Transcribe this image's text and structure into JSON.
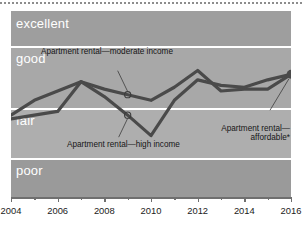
{
  "chart_data": {
    "type": "line",
    "title": "",
    "subtitle": "",
    "xlabel": "",
    "ylabel": "",
    "xlim": [
      2004,
      2016
    ],
    "ylim": [
      0,
      100
    ],
    "grid": false,
    "legend_position": "inline-annotations",
    "x": [
      2004,
      2005,
      2006,
      2007,
      2008,
      2009,
      2010,
      2011,
      2012,
      2013,
      2014,
      2015,
      2016
    ],
    "y_bands": [
      {
        "label": "excellent",
        "range": [
          81,
          100
        ],
        "color": "#9e9e9e"
      },
      {
        "label": "good",
        "range": [
          48,
          81
        ],
        "color": "#a8a8a8"
      },
      {
        "label": "fair",
        "range": [
          21,
          48
        ],
        "color": "#aeaeae"
      },
      {
        "label": "poor",
        "range": [
          0,
          21
        ],
        "color": "#9a9a9a"
      }
    ],
    "series": [
      {
        "name": "Apartment rental—moderate income",
        "color": "#4a4a4a",
        "values": [
          44,
          52,
          57,
          62,
          58,
          55,
          52,
          59,
          68,
          57,
          58,
          58,
          66
        ]
      },
      {
        "name": "Apartment rental—high income",
        "color": "#4a4a4a",
        "values": [
          42,
          44,
          46,
          62,
          54,
          44,
          33,
          52,
          63,
          60,
          59,
          63,
          66
        ]
      }
    ],
    "annotations": [
      {
        "name": "moderate-income-callout",
        "text": "Apartment rental—moderate income",
        "points_to_series": "Apartment rental—moderate income",
        "points_to_x": 2009,
        "marker": "open-circle"
      },
      {
        "name": "high-income-callout",
        "text": "Apartment rental—high income",
        "points_to_series": "Apartment rental—high income",
        "points_to_x": 2009,
        "marker": "open-circle"
      },
      {
        "name": "affordable-callout",
        "text": "Apartment rental—affordable*",
        "points_to_series": "endpoint",
        "points_to_x": 2016,
        "marker": "filled-dot"
      }
    ]
  },
  "bands": {
    "excellent": "excellent",
    "good": "good",
    "fair": "fair",
    "poor": "poor"
  },
  "annotations": {
    "moderate": "Apartment rental—moderate income",
    "high": "Apartment rental—high income",
    "affordable": "Apartment rental—affordable*"
  },
  "axis": {
    "x_ticks": [
      "2004",
      "2006",
      "2008",
      "2010",
      "2012",
      "2014",
      "2016"
    ],
    "x_tick_values": [
      2004,
      2006,
      2008,
      2010,
      2012,
      2014,
      2016
    ],
    "x_minor_values": [
      2005,
      2007,
      2009,
      2011,
      2013,
      2015
    ]
  },
  "colors": {
    "line": "#4a4a4a",
    "band_divider": "#ffffff",
    "band_label": "#ffffff",
    "annotation_text": "#161616",
    "axis": "#6f6f6f",
    "page_background": "#ffffff"
  }
}
